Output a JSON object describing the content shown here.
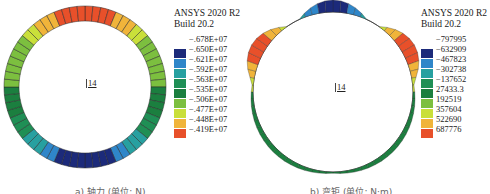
{
  "chart_data": [
    {
      "type": "heatmap",
      "title": "",
      "caption": "a) 轴力 (单位: N)",
      "software": "ANSYS 2020 R2",
      "build": "Build 20.2",
      "node_label": "14",
      "legend_levels": [
        "-.678E+07",
        "-.650E+07",
        "-.621E+07",
        "-.592E+07",
        "-.563E+07",
        "-.535E+07",
        "-.506E+07",
        "-.477E+07",
        "-.448E+07",
        "-.419E+07"
      ],
      "legend_values": [
        -6780000,
        -6500000,
        -6210000,
        -5920000,
        -5630000,
        -5350000,
        -5060000,
        -4770000,
        -4480000,
        -4190000
      ],
      "colors": [
        "#1c2a7a",
        "#2f86c9",
        "#27a0a0",
        "#1f8f55",
        "#1b7f3f",
        "#7cbf3f",
        "#c9df3a",
        "#f0b43a",
        "#e8502a"
      ],
      "distribution": "axial force around circular tunnel lining: max compression (blue) at bottom, min (red) at crown"
    },
    {
      "type": "heatmap",
      "title": "",
      "caption": "b) 弯矩 (单位: N·m)",
      "software": "ANSYS 2020 R2",
      "build": "Build 20.2",
      "node_label": "14",
      "legend_levels": [
        "-797995",
        "-632909",
        "-467823",
        "-302738",
        "-137652",
        "27433.3",
        "192519",
        "357604",
        "522690",
        "687776"
      ],
      "legend_values": [
        -797995,
        -632909,
        -467823,
        -302738,
        -137652,
        27433.3,
        192519,
        357604,
        522690,
        687776
      ],
      "colors": [
        "#1c2a7a",
        "#2f86c9",
        "#27a0a0",
        "#1f8f55",
        "#1b7f3f",
        "#7cbf3f",
        "#c9df3a",
        "#f0b43a",
        "#e8502a"
      ],
      "distribution": "bending moment diagram: negative peak (blue) at crown, positive peaks (red) at upper shoulders, small (green) along lower half"
    }
  ],
  "panels": [
    {
      "software": "ANSYS 2020 R2",
      "build": "Build 20.2",
      "node_label": "14",
      "caption": "a) 轴力 (单位: N)",
      "legend": [
        {
          "label": "-.678E+07"
        },
        {
          "label": "-.650E+07",
          "color": "#1c2a7a"
        },
        {
          "label": "-.621E+07",
          "color": "#2f86c9"
        },
        {
          "label": "-.592E+07",
          "color": "#27a0a0"
        },
        {
          "label": "-.563E+07",
          "color": "#1f8f55"
        },
        {
          "label": "-.535E+07",
          "color": "#1b7f3f"
        },
        {
          "label": "-.506E+07",
          "color": "#7cbf3f"
        },
        {
          "label": "-.477E+07",
          "color": "#c9df3a"
        },
        {
          "label": "-.448E+07",
          "color": "#f0b43a"
        },
        {
          "label": "-.419E+07",
          "color": "#e8502a"
        }
      ]
    },
    {
      "software": "ANSYS 2020 R2",
      "build": "Build 20.2",
      "node_label": "14",
      "caption": "b) 弯矩 (单位: N·m)",
      "legend": [
        {
          "label": "-797995"
        },
        {
          "label": "-632909",
          "color": "#1c2a7a"
        },
        {
          "label": "-467823",
          "color": "#2f86c9"
        },
        {
          "label": "-302738",
          "color": "#27a0a0"
        },
        {
          "label": "-137652",
          "color": "#1f8f55"
        },
        {
          "label": "27433.3",
          "color": "#1b7f3f"
        },
        {
          "label": "192519",
          "color": "#7cbf3f"
        },
        {
          "label": "357604",
          "color": "#c9df3a"
        },
        {
          "label": "522690",
          "color": "#f0b43a"
        },
        {
          "label": "687776",
          "color": "#e8502a"
        }
      ]
    }
  ]
}
